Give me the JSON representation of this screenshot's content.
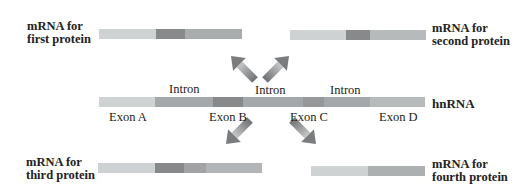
{
  "hnrna": {
    "label": "hnRNA",
    "exons": [
      "Exon A",
      "Exon B",
      "Exon C",
      "Exon D"
    ],
    "introns": [
      "Intron",
      "Intron",
      "Intron"
    ]
  },
  "products": [
    {
      "label_line1": "mRNA for",
      "label_line2": "first protein",
      "exons": [
        "Exon A",
        "Exon B",
        "Exon C"
      ]
    },
    {
      "label_line1": "mRNA for",
      "label_line2": "second protein",
      "exons": [
        "Exon A",
        "Exon B",
        "Exon D"
      ]
    },
    {
      "label_line1": "mRNA for",
      "label_line2": "third protein",
      "exons": [
        "Exon A",
        "Exon B",
        "Exon C",
        "Exon D"
      ]
    },
    {
      "label_line1": "mRNA for",
      "label_line2": "fourth protein",
      "exons": [
        "Exon A",
        "Exon D"
      ]
    }
  ],
  "colors": {
    "exon_a": "#cfd2d3",
    "intron": "#a5a8aa",
    "exon_b": "#87898b",
    "exon_c": "#999b9d",
    "exon_d": "#b7babb",
    "arrow": "#8a8c8e"
  }
}
